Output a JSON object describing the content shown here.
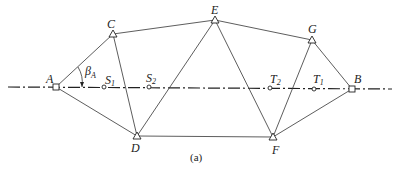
{
  "figure": {
    "caption": "(a)",
    "angle_label": "β",
    "angle_sub": "A"
  },
  "control_points": [
    {
      "id": "A",
      "type": "square",
      "x": 56,
      "y": 87
    },
    {
      "id": "B",
      "type": "square",
      "x": 352,
      "y": 89
    },
    {
      "id": "C",
      "type": "triangle",
      "x": 113,
      "y": 34
    },
    {
      "id": "D",
      "type": "triangle",
      "x": 137,
      "y": 136
    },
    {
      "id": "E",
      "type": "triangle",
      "x": 215,
      "y": 20
    },
    {
      "id": "F",
      "type": "triangle",
      "x": 273,
      "y": 137
    },
    {
      "id": "G",
      "type": "triangle",
      "x": 312,
      "y": 40
    }
  ],
  "axis_points": [
    {
      "id": "S",
      "sub": "1",
      "x": 104,
      "y": 87
    },
    {
      "id": "S",
      "sub": "2",
      "x": 149,
      "y": 87
    },
    {
      "id": "T",
      "sub": "2",
      "x": 270,
      "y": 88
    },
    {
      "id": "T",
      "sub": "1",
      "x": 314,
      "y": 89
    }
  ],
  "labels": {
    "A": "A",
    "B": "B",
    "C": "C",
    "D": "D",
    "E": "E",
    "F": "F",
    "G": "G",
    "S1": "S",
    "S1_sub": "1",
    "S2": "S",
    "S2_sub": "2",
    "T2": "T",
    "T2_sub": "2",
    "T1": "T",
    "T1_sub": "1"
  }
}
